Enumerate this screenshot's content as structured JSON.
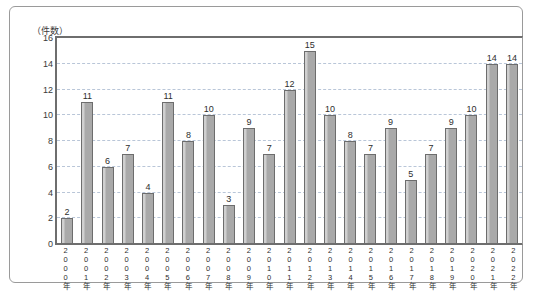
{
  "top_cut_text": "                   ",
  "unit_label": "（件数）",
  "colors": {
    "bar_fill": "#a9a9a9",
    "bar_stroke": "#6d6d6d",
    "gridline": "#b9c6d8",
    "axis": "#6e6e6e",
    "frame": "#9a9a9a",
    "text": "#2e2e2e"
  },
  "chart_data": {
    "type": "bar",
    "title": "",
    "subtitle": "",
    "xlabel": "",
    "ylabel": "（件数）",
    "ylim": [
      0,
      16
    ],
    "yticks": [
      0,
      2,
      4,
      6,
      8,
      10,
      12,
      14,
      16
    ],
    "grid": true,
    "legend": false,
    "legend_position": "none",
    "data_labels": true,
    "categories": [
      "2000年",
      "2001年",
      "2002年",
      "2003年",
      "2004年",
      "2005年",
      "2006年",
      "2007年",
      "2008年",
      "2009年",
      "2010年",
      "2011年",
      "2012年",
      "2013年",
      "2014年",
      "2015年",
      "2016年",
      "2017年",
      "2018年",
      "2019年",
      "2020年",
      "2021年",
      "2022年"
    ],
    "values": [
      2,
      11,
      6,
      7,
      4,
      11,
      8,
      10,
      3,
      9,
      7,
      12,
      15,
      10,
      8,
      7,
      9,
      5,
      7,
      9,
      10,
      14,
      14
    ]
  }
}
